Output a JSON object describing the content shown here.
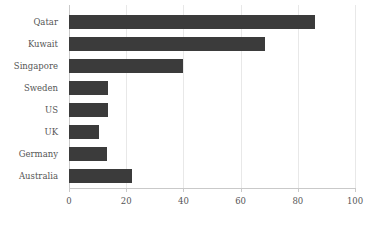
{
  "chart_data": {
    "type": "bar",
    "orientation": "horizontal",
    "title": "",
    "subtitle": "",
    "xlabel": "",
    "ylabel": "",
    "categories": [
      "Qatar",
      "Kuwait",
      "Singapore",
      "Sweden",
      "US",
      "UK",
      "Germany",
      "Australia"
    ],
    "values": [
      86,
      68.5,
      40,
      13.6,
      13.6,
      10.5,
      13.3,
      22
    ],
    "xlim": [
      0,
      100
    ],
    "xticks": [
      0,
      20,
      40,
      60,
      80,
      100
    ],
    "xtick_labels": [
      "0",
      "20",
      "40",
      "60",
      "80",
      "100"
    ],
    "grid": "vertical-only",
    "legend": null,
    "series": [
      {
        "name": "",
        "values": [
          86,
          68.5,
          40,
          13.6,
          13.6,
          10.5,
          13.3,
          22
        ]
      }
    ],
    "bar_color": "#3b3b3b",
    "grid_color": "#e8e8e8",
    "axis_color": "#c9c9c9",
    "text_color": "#555555",
    "background_color": "#ffffff"
  }
}
